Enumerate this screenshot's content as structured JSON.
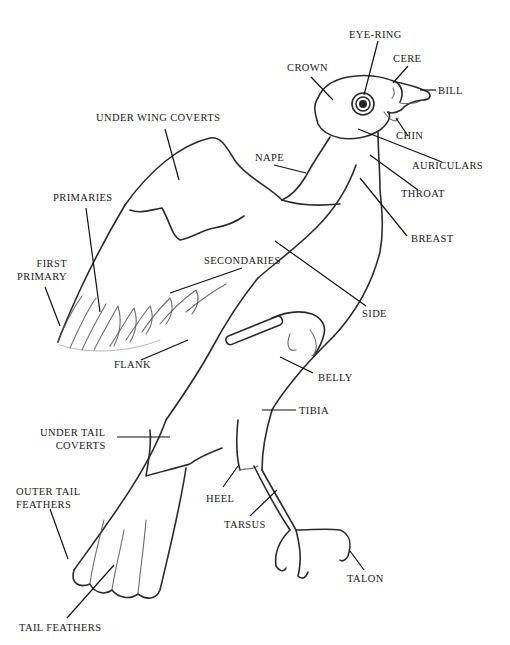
{
  "figure": {
    "ink_color": "#2b2b2b",
    "background": "#ffffff"
  },
  "labels": [
    {
      "id": "eye-ring",
      "text": "EYE-RING",
      "x": 349,
      "y": 34,
      "align": "left",
      "leader": [
        [
          378,
          41
        ],
        [
          364,
          95
        ]
      ]
    },
    {
      "id": "cere",
      "text": "CERE",
      "x": 393,
      "y": 57,
      "align": "left",
      "leader": [
        [
          408,
          66
        ],
        [
          393,
          83
        ]
      ]
    },
    {
      "id": "crown",
      "text": "CROWN",
      "x": 287,
      "y": 66,
      "align": "left",
      "leader": [
        [
          311,
          77
        ],
        [
          333,
          100
        ]
      ]
    },
    {
      "id": "bill",
      "text": "BILL",
      "x": 438,
      "y": 86,
      "align": "left",
      "leader": [
        [
          436,
          90
        ],
        [
          420,
          90
        ]
      ]
    },
    {
      "id": "chin",
      "text": "CHIN",
      "x": 396,
      "y": 131,
      "align": "left",
      "leader": [
        [
          408,
          136
        ],
        [
          396,
          118
        ]
      ]
    },
    {
      "id": "under-wing-coverts",
      "text": "UNDER WING COVERTS",
      "x": 96,
      "y": 113,
      "align": "left",
      "leader": [
        [
          165,
          129
        ],
        [
          179,
          180
        ]
      ]
    },
    {
      "id": "auriculars",
      "text": "AURICULARS",
      "x": 412,
      "y": 161,
      "align": "left",
      "leader": [
        [
          442,
          162
        ],
        [
          358,
          129
        ]
      ]
    },
    {
      "id": "nape",
      "text": "NAPE",
      "x": 255,
      "y": 153,
      "align": "left",
      "leader": [
        [
          274,
          165
        ],
        [
          306,
          173
        ]
      ]
    },
    {
      "id": "throat",
      "text": "THROAT",
      "x": 401,
      "y": 189,
      "align": "left",
      "leader": [
        [
          418,
          190
        ],
        [
          370,
          155
        ]
      ]
    },
    {
      "id": "primaries",
      "text": "PRIMARIES",
      "x": 53,
      "y": 192,
      "align": "left",
      "leader": [
        [
          86,
          208
        ],
        [
          100,
          312
        ]
      ]
    },
    {
      "id": "breast",
      "text": "BREAST",
      "x": 411,
      "y": 233,
      "align": "left",
      "leader": [
        [
          407,
          236
        ],
        [
          360,
          178
        ]
      ]
    },
    {
      "id": "secondaries",
      "text": "SECONDARIES",
      "x": 204,
      "y": 255,
      "align": "left",
      "leader": [
        [
          242,
          268
        ],
        [
          170,
          293
        ]
      ]
    },
    {
      "id": "first-primary",
      "text": "FIRST\nPRIMARY",
      "x": 17,
      "y": 258,
      "align": "right",
      "leader": [
        [
          45,
          287
        ],
        [
          60,
          326
        ]
      ]
    },
    {
      "id": "side",
      "text": "SIDE",
      "x": 362,
      "y": 308,
      "align": "left",
      "leader": [
        [
          366,
          306
        ],
        [
          275,
          241
        ]
      ]
    },
    {
      "id": "flank",
      "text": "FLANK",
      "x": 114,
      "y": 359,
      "align": "left",
      "leader": [
        [
          141,
          360
        ],
        [
          188,
          340
        ]
      ]
    },
    {
      "id": "belly",
      "text": "BELLY",
      "x": 318,
      "y": 372,
      "align": "left",
      "leader": [
        [
          313,
          373
        ],
        [
          280,
          357
        ]
      ]
    },
    {
      "id": "tibia",
      "text": "TIBIA",
      "x": 299,
      "y": 405,
      "align": "left",
      "leader": [
        [
          296,
          410
        ],
        [
          262,
          410
        ]
      ]
    },
    {
      "id": "under-tail-coverts",
      "text": "UNDER TAIL\nCOVERTS",
      "x": 40,
      "y": 427,
      "align": "right",
      "leader": [
        [
          117,
          437
        ],
        [
          170,
          437
        ]
      ]
    },
    {
      "id": "heel",
      "text": "HEEL",
      "x": 206,
      "y": 492,
      "align": "left",
      "leader": [
        [
          223,
          487
        ],
        [
          238,
          466
        ]
      ]
    },
    {
      "id": "outer-tail-feathers",
      "text": "OUTER TAIL\nFEATHERS",
      "x": 16,
      "y": 486,
      "align": "left",
      "leader": [
        [
          50,
          509
        ],
        [
          68,
          559
        ]
      ]
    },
    {
      "id": "tarsus",
      "text": "TARSUS",
      "x": 224,
      "y": 518,
      "align": "left",
      "leader": [
        [
          250,
          516
        ],
        [
          277,
          490
        ]
      ]
    },
    {
      "id": "talon",
      "text": "TALON",
      "x": 347,
      "y": 573,
      "align": "left",
      "leader": [
        [
          364,
          570
        ],
        [
          350,
          551
        ]
      ]
    },
    {
      "id": "tail-feathers",
      "text": "TAIL FEATHERS",
      "x": 19,
      "y": 620,
      "align": "left",
      "leader": [
        [
          67,
          618
        ],
        [
          114,
          565
        ]
      ]
    }
  ]
}
